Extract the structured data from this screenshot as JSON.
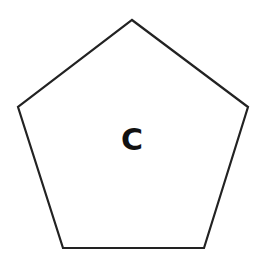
{
  "diagram": {
    "shape": "pentagon",
    "label": "C",
    "stroke_color": "#222222",
    "fill_color": "#ffffff",
    "vertices": [
      [
        132,
        20
      ],
      [
        248,
        107
      ],
      [
        204,
        248
      ],
      [
        63,
        248
      ],
      [
        18,
        107
      ]
    ]
  }
}
